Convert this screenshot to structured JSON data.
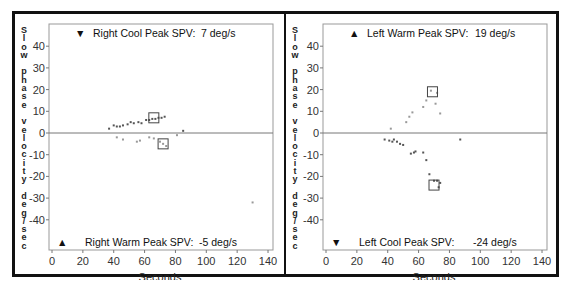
{
  "chart_data": [
    {
      "type": "scatter",
      "panel": "left",
      "title": "",
      "xlabel": "Seconds",
      "ylabel": "Slow phase velocity deg/sec",
      "xlim": [
        0,
        140
      ],
      "ylim": [
        -50,
        50
      ],
      "xticks": [
        0,
        20,
        40,
        60,
        80,
        100,
        120,
        140
      ],
      "yticks": [
        40,
        30,
        20,
        10,
        0,
        -10,
        -20,
        -30,
        -40
      ],
      "grid": false,
      "annotations": [
        {
          "position": "top",
          "marker": "down-triangle",
          "label": "Right Cool Peak SPV:",
          "value": "7 deg/s"
        },
        {
          "position": "bottom",
          "marker": "up-triangle",
          "label": "Right Warm Peak SPV:",
          "value": "-5 deg/s"
        }
      ],
      "series": [
        {
          "name": "Right Cool",
          "color": "#555555",
          "points": [
            [
              37,
              2
            ],
            [
              40,
              3.5
            ],
            [
              42,
              3
            ],
            [
              44,
              3
            ],
            [
              46,
              3.5
            ],
            [
              49,
              4
            ],
            [
              51,
              5
            ],
            [
              53,
              4.5
            ],
            [
              56,
              5
            ],
            [
              58,
              4.5
            ],
            [
              61,
              6
            ],
            [
              63,
              6
            ],
            [
              65,
              6.5
            ],
            [
              67,
              6.5
            ],
            [
              69,
              7
            ],
            [
              71,
              7
            ],
            [
              73,
              7.5
            ],
            [
              85,
              1
            ]
          ],
          "peak_box": {
            "x": 66,
            "y": 7
          }
        },
        {
          "name": "Right Warm",
          "color": "#999999",
          "points": [
            [
              42,
              -2
            ],
            [
              46,
              -3
            ],
            [
              55,
              -4
            ],
            [
              57,
              -3.5
            ],
            [
              63,
              -2
            ],
            [
              66,
              -2.5
            ],
            [
              70,
              -4
            ],
            [
              72,
              -5
            ],
            [
              74,
              -6
            ],
            [
              81,
              -1
            ],
            [
              130,
              -32
            ]
          ],
          "peak_box": {
            "x": 72,
            "y": -5
          }
        }
      ]
    },
    {
      "type": "scatter",
      "panel": "right",
      "title": "",
      "xlabel": "Seconds",
      "ylabel": "Slow phase velocity deg/sec",
      "xlim": [
        0,
        140
      ],
      "ylim": [
        -50,
        50
      ],
      "xticks": [
        0,
        20,
        40,
        60,
        80,
        100,
        120,
        140
      ],
      "yticks": [
        40,
        30,
        20,
        10,
        0,
        -10,
        -20,
        -30,
        -40
      ],
      "grid": false,
      "annotations": [
        {
          "position": "top",
          "marker": "up-triangle",
          "label": "Left Warm Peak SPV:",
          "value": "19 deg/s"
        },
        {
          "position": "bottom",
          "marker": "down-triangle",
          "label": "Left Cool Peak SPV:",
          "value": "-24 deg/s"
        }
      ],
      "series": [
        {
          "name": "Left Warm",
          "color": "#999999",
          "points": [
            [
              42,
              2
            ],
            [
              52,
              5
            ],
            [
              54,
              7.5
            ],
            [
              56,
              9.5
            ],
            [
              63,
              12
            ],
            [
              65,
              15
            ],
            [
              68,
              19.5
            ],
            [
              72,
              18.5
            ],
            [
              71,
              13.5
            ],
            [
              74,
              9
            ]
          ],
          "peak_box": {
            "x": 69,
            "y": 19
          }
        },
        {
          "name": "Left Cool",
          "color": "#555555",
          "points": [
            [
              38,
              -3
            ],
            [
              41,
              -3.5
            ],
            [
              43,
              -4
            ],
            [
              44,
              -3
            ],
            [
              46,
              -4
            ],
            [
              48,
              -5
            ],
            [
              50,
              -5.5
            ],
            [
              55,
              -9.5
            ],
            [
              57,
              -9
            ],
            [
              58,
              -8.5
            ],
            [
              63,
              -9
            ],
            [
              65,
              -12.5
            ],
            [
              67,
              -19
            ],
            [
              70,
              -22
            ],
            [
              72,
              -22
            ],
            [
              74,
              -23
            ],
            [
              73,
              -25
            ],
            [
              87,
              -3
            ]
          ],
          "peak_box": {
            "x": 70,
            "y": -24
          }
        }
      ]
    }
  ],
  "panels": {
    "left": {
      "ylabel_vertical": "S\nl\no\nw\n \np\nh\na\ns\ne\n \nv\ne\nl\no\nc\ni\nt\ny\n \nd\ne\ng\n/\ns\ne\nc",
      "xlabel": "Seconds",
      "top_marker": "▼",
      "top_label": "Right Cool Peak SPV:",
      "top_value": "7 deg/s",
      "bottom_marker": "▲",
      "bottom_label": "Right Warm Peak SPV:",
      "bottom_value": "-5 deg/s"
    },
    "right": {
      "ylabel_vertical": "S\nl\no\nw\n \np\nh\na\ns\ne\n \nv\ne\nl\no\nc\ni\nt\ny\n \nd\ne\ng\n/\ns\ne\nc",
      "xlabel": "Seconds",
      "top_marker": "▲",
      "top_label": "Left Warm Peak SPV:",
      "top_value": "19 deg/s",
      "bottom_marker": "▼",
      "bottom_label": "Left Cool Peak SPV:",
      "bottom_value": "-24 deg/s"
    }
  }
}
